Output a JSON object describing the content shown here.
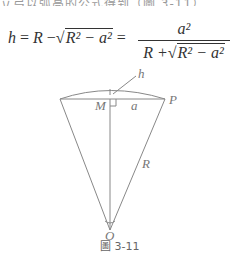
{
  "top_text": "立弓以弧高的公式得到（圖 3-11）",
  "formula": {
    "lhs": "h",
    "eq1": "=",
    "R": "R",
    "minus": "−",
    "rad": "R² − a²",
    "eq2": "=",
    "num": "a²",
    "den_prefix": "R +",
    "den_rad": "R² − a²"
  },
  "diagram": {
    "labels": {
      "h": "h",
      "M": "M",
      "a": "a",
      "P": "P",
      "R": "R",
      "O": "O"
    }
  },
  "caption": "圖 3-11"
}
